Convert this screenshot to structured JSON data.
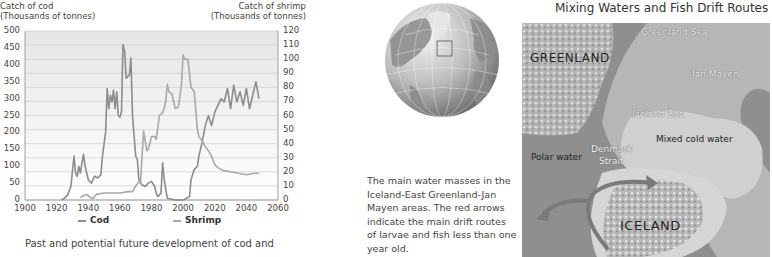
{
  "chart_data": {
    "type": "line",
    "title": "",
    "xlabel": "",
    "ylabel": "Catch of cod (Thousands of tonnes)",
    "ylabel_right": "Catch of shrimp (Thousands of tonnes)",
    "xlim": [
      1900,
      2060
    ],
    "ylim": [
      0,
      500
    ],
    "ylim_right": [
      0,
      120
    ],
    "x_ticks": [
      1900,
      1920,
      1940,
      1960,
      1980,
      2000,
      2020,
      2040,
      2060
    ],
    "y_ticks": [
      0,
      50,
      100,
      150,
      200,
      250,
      300,
      350,
      400,
      450,
      500
    ],
    "y_ticks_right": [
      0,
      10,
      20,
      30,
      40,
      50,
      60,
      70,
      80,
      90,
      100,
      110,
      120
    ],
    "grid": true,
    "legend_position": "bottom",
    "series": [
      {
        "name": "Cod",
        "axis": "left",
        "color": "#8c8c8c",
        "x": [
          1923,
          1925,
          1927,
          1929,
          1931,
          1932,
          1933,
          1934,
          1935,
          1937,
          1938,
          1940,
          1942,
          1944,
          1946,
          1948,
          1949,
          1951,
          1952,
          1953,
          1954,
          1955,
          1956,
          1957,
          1958,
          1959,
          1960,
          1961,
          1962,
          1963,
          1964,
          1966,
          1967,
          1968,
          1970,
          1971,
          1972,
          1974,
          1976,
          1978,
          1980,
          1982,
          1983,
          1984,
          1986,
          1987,
          1988,
          1990,
          1995,
          2000,
          2004,
          2005,
          2007,
          2009,
          2010,
          2012,
          2014,
          2016,
          2018,
          2020,
          2022,
          2024,
          2026,
          2028,
          2030,
          2032,
          2034,
          2036,
          2038,
          2040,
          2042,
          2044,
          2046,
          2048
        ],
        "values": [
          0,
          5,
          15,
          40,
          130,
          80,
          70,
          100,
          80,
          135,
          100,
          60,
          50,
          70,
          65,
          75,
          130,
          200,
          330,
          270,
          310,
          290,
          325,
          270,
          320,
          250,
          245,
          260,
          460,
          440,
          360,
          370,
          420,
          250,
          130,
          120,
          60,
          45,
          40,
          50,
          55,
          40,
          20,
          10,
          20,
          110,
          60,
          5,
          0,
          0,
          10,
          60,
          90,
          100,
          130,
          170,
          220,
          250,
          220,
          260,
          280,
          300,
          290,
          330,
          270,
          340,
          290,
          320,
          280,
          330,
          270,
          310,
          350,
          300
        ]
      },
      {
        "name": "Shrimp",
        "axis": "right",
        "color": "#a8a8a8",
        "x": [
          1935,
          1937,
          1939,
          1941,
          1943,
          1945,
          1950,
          1955,
          1960,
          1965,
          1968,
          1970,
          1972,
          1973,
          1975,
          1977,
          1978,
          1980,
          1982,
          1983,
          1985,
          1987,
          1988,
          1989,
          1990,
          1991,
          1993,
          1995,
          1997,
          1999,
          2000,
          2001,
          2003,
          2005,
          2007,
          2009,
          2010,
          2012,
          2014,
          2016,
          2018,
          2020,
          2022,
          2025,
          2030,
          2035,
          2040,
          2045,
          2048
        ],
        "values": [
          2,
          3,
          4,
          2,
          1,
          4,
          5,
          5,
          5,
          6,
          6,
          10,
          13,
          12,
          49,
          35,
          36,
          45,
          45,
          43,
          60,
          62,
          65,
          70,
          82,
          77,
          75,
          65,
          66,
          82,
          103,
          100,
          100,
          80,
          77,
          50,
          45,
          42,
          38,
          35,
          31,
          25,
          23,
          21,
          20,
          19,
          18,
          19,
          19
        ]
      }
    ]
  },
  "chart": {
    "left_axis_title_line1": "Catch of cod",
    "left_axis_title_line2": "(Thousands of tonnes)",
    "right_axis_title_line1": "Catch of shrimp",
    "right_axis_title_line2": "(Thousands of tonnes)",
    "legend": {
      "cod_label": "Cod",
      "shrimp_label": "Shrimp"
    },
    "caption": "Past and potential future development of cod and"
  },
  "globe": {
    "caption": "The main water masses in the Iceland-East Greenland-Jan Mayen areas. The red arrows indicate the main drift routes of larvae and fish less than one year old."
  },
  "map": {
    "title": "Mixing Waters and Fish Drift Routes",
    "labels": {
      "greenland": "GREENLAND",
      "greenland_sea": "Greenland Sea",
      "jan_mayen": "Jan Mayen",
      "iceland_sea": "Iceland Sea",
      "denmark_strait_1": "Denmark",
      "denmark_strait_2": "Strait",
      "polar_water": "Polar water",
      "mixed_cold_water": "Mixed cold water",
      "iceland": "ICELAND"
    },
    "colors": {
      "polar": "#8f8f8f",
      "mixed": "#c9c9c9",
      "land": "#b0b0b0",
      "arrow": "#7a7a7a"
    }
  }
}
